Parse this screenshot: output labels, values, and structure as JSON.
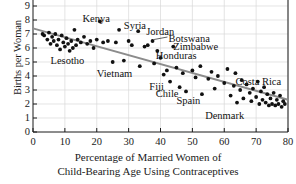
{
  "chart_data": {
    "type": "scatter",
    "title": "",
    "xlabel": "Percentage of Married Women of Child-Bearing Age Using Contraceptives",
    "xlabel_line1": "Percentage of Married Women of",
    "xlabel_line2": "Child-Bearing Age Using Contraceptives",
    "ylabel": "Births per Woman",
    "xlim": [
      0,
      80
    ],
    "ylim": [
      0,
      10
    ],
    "xticks": [
      0,
      10,
      20,
      30,
      40,
      50,
      60,
      70,
      80
    ],
    "yticks": [
      0,
      1,
      2,
      3,
      4,
      5,
      6,
      7,
      8,
      9,
      10
    ],
    "grid": true,
    "grid_color": "#d8d8d8",
    "legend": "none",
    "point_color": "#111111",
    "trendline": {
      "label": "least-squares regression line",
      "color": "#8c8c8c",
      "x_start": 0,
      "y_start": 7.4,
      "x_end": 80,
      "y_end": 2.3
    },
    "points": [
      {
        "x": 3.0,
        "y": 7.0
      },
      {
        "x": 3.5,
        "y": 6.9
      },
      {
        "x": 4.5,
        "y": 6.6
      },
      {
        "x": 5.0,
        "y": 7.1
      },
      {
        "x": 5.5,
        "y": 6.3
      },
      {
        "x": 6.0,
        "y": 6.8
      },
      {
        "x": 6.5,
        "y": 6.5
      },
      {
        "x": 7.0,
        "y": 7.0
      },
      {
        "x": 7.5,
        "y": 6.2
      },
      {
        "x": 8.0,
        "y": 6.6
      },
      {
        "x": 8.5,
        "y": 5.9
      },
      {
        "x": 9.0,
        "y": 6.9
      },
      {
        "x": 9.5,
        "y": 6.4
      },
      {
        "x": 10.0,
        "y": 6.1
      },
      {
        "x": 10.5,
        "y": 6.7
      },
      {
        "x": 11.0,
        "y": 6.3
      },
      {
        "x": 11.5,
        "y": 5.8
      },
      {
        "x": 12.0,
        "y": 6.5
      },
      {
        "x": 12.5,
        "y": 6.0
      },
      {
        "x": 13.0,
        "y": 7.3
      },
      {
        "x": 13.5,
        "y": 6.2
      },
      {
        "x": 14.0,
        "y": 6.6
      },
      {
        "x": 15.0,
        "y": 6.4
      },
      {
        "x": 16.0,
        "y": 6.8
      },
      {
        "x": 17.0,
        "y": 6.3
      },
      {
        "x": 18.0,
        "y": 6.5
      },
      {
        "x": 19.0,
        "y": 6.0
      },
      {
        "x": 20.0,
        "y": 6.6
      },
      {
        "x": 21.0,
        "y": 7.9,
        "label": "Kenya"
      },
      {
        "x": 22.0,
        "y": 6.4
      },
      {
        "x": 23.5,
        "y": 6.5
      },
      {
        "x": 25.0,
        "y": 5.0
      },
      {
        "x": 26.0,
        "y": 6.4
      },
      {
        "x": 27.0,
        "y": 7.3,
        "label": "Syria"
      },
      {
        "x": 28.5,
        "y": 5.1
      },
      {
        "x": 30.0,
        "y": 6.5
      },
      {
        "x": 31.0,
        "y": 6.2
      },
      {
        "x": 33.0,
        "y": 7.2,
        "label": "Jordan"
      },
      {
        "x": 33.5,
        "y": 4.7
      },
      {
        "x": 35.0,
        "y": 6.1
      },
      {
        "x": 36.0,
        "y": 6.2
      },
      {
        "x": 37.5,
        "y": 6.5,
        "label": "Botswana"
      },
      {
        "x": 38.0,
        "y": 4.9
      },
      {
        "x": 39.0,
        "y": 5.8,
        "label": "Zimbabwe"
      },
      {
        "x": 40.0,
        "y": 5.3,
        "label": "Honduras"
      },
      {
        "x": 41.0,
        "y": 4.1
      },
      {
        "x": 42.0,
        "y": 4.4
      },
      {
        "x": 43.0,
        "y": 3.6,
        "label": "Fiji"
      },
      {
        "x": 44.0,
        "y": 6.1
      },
      {
        "x": 45.0,
        "y": 4.6
      },
      {
        "x": 46.0,
        "y": 3.2,
        "label": "Chile"
      },
      {
        "x": 47.0,
        "y": 4.2
      },
      {
        "x": 48.0,
        "y": 2.9
      },
      {
        "x": 50.0,
        "y": 4.4
      },
      {
        "x": 51.0,
        "y": 3.9
      },
      {
        "x": 52.5,
        "y": 4.7
      },
      {
        "x": 53.0,
        "y": 2.7,
        "label": "Spain"
      },
      {
        "x": 55.0,
        "y": 3.8
      },
      {
        "x": 56.0,
        "y": 4.3
      },
      {
        "x": 57.0,
        "y": 3.1
      },
      {
        "x": 58.0,
        "y": 4.0
      },
      {
        "x": 60.0,
        "y": 3.5
      },
      {
        "x": 61.0,
        "y": 4.5
      },
      {
        "x": 62.0,
        "y": 2.6
      },
      {
        "x": 63.0,
        "y": 3.3
      },
      {
        "x": 63.5,
        "y": 4.2
      },
      {
        "x": 64.0,
        "y": 2.1
      },
      {
        "x": 65.0,
        "y": 3.0
      },
      {
        "x": 65.5,
        "y": 3.7
      },
      {
        "x": 66.0,
        "y": 2.4
      },
      {
        "x": 67.0,
        "y": 3.4
      },
      {
        "x": 68.0,
        "y": 2.8
      },
      {
        "x": 68.5,
        "y": 2.2
      },
      {
        "x": 69.0,
        "y": 3.1
      },
      {
        "x": 70.0,
        "y": 2.5
      },
      {
        "x": 70.5,
        "y": 3.6,
        "label": "Costa Rica"
      },
      {
        "x": 71.0,
        "y": 2.0
      },
      {
        "x": 71.5,
        "y": 2.9
      },
      {
        "x": 72.0,
        "y": 2.3
      },
      {
        "x": 72.5,
        "y": 3.2
      },
      {
        "x": 73.0,
        "y": 2.1
      },
      {
        "x": 73.5,
        "y": 2.7
      },
      {
        "x": 74.0,
        "y": 1.9
      },
      {
        "x": 74.5,
        "y": 2.4
      },
      {
        "x": 75.0,
        "y": 2.0
      },
      {
        "x": 75.5,
        "y": 2.8
      },
      {
        "x": 76.0,
        "y": 1.9
      },
      {
        "x": 76.5,
        "y": 2.3
      },
      {
        "x": 77.0,
        "y": 2.0
      },
      {
        "x": 77.5,
        "y": 2.6
      },
      {
        "x": 78.0,
        "y": 1.8
      },
      {
        "x": 78.5,
        "y": 2.2
      },
      {
        "x": 79.0,
        "y": 2.0
      }
    ],
    "annotations": [
      {
        "text": "Kenya",
        "x": 15.5,
        "y": 8.4,
        "leader": false
      },
      {
        "text": "Syria",
        "x": 28.5,
        "y": 7.9,
        "leader": false
      },
      {
        "text": "Jordan",
        "x": 35.5,
        "y": 7.5,
        "leader": false
      },
      {
        "text": "Botswana",
        "x": 42.5,
        "y": 7.0,
        "leader": true
      },
      {
        "text": "Zimbabwe",
        "x": 44.0,
        "y": 6.4,
        "leader": false
      },
      {
        "text": "Honduras",
        "x": 38.5,
        "y": 5.8,
        "leader": false
      },
      {
        "text": "Lesotho",
        "x": 5.5,
        "y": 5.4,
        "leader": false
      },
      {
        "text": "Vietnam",
        "x": 20.0,
        "y": 4.5,
        "leader": false
      },
      {
        "text": "Fiji",
        "x": 36.5,
        "y": 3.6,
        "leader": false
      },
      {
        "text": "Chile",
        "x": 38.5,
        "y": 3.1,
        "leader": false
      },
      {
        "text": "Spain",
        "x": 45.0,
        "y": 2.6,
        "leader": false
      },
      {
        "text": "Costa Rica",
        "x": 63.5,
        "y": 3.9,
        "leader": false
      },
      {
        "text": "Denmark",
        "x": 54.0,
        "y": 1.5,
        "leader": false
      }
    ]
  }
}
